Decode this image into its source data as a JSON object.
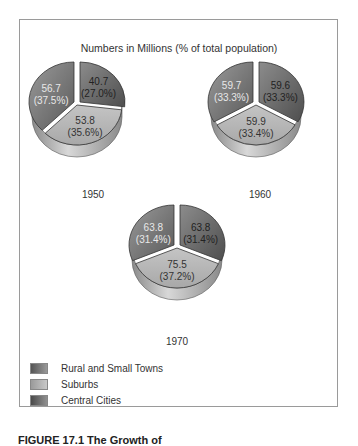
{
  "chart_data": {
    "type": "pie",
    "title": "Numbers in Millions (% of total population)",
    "legend": {
      "position": "bottom-left",
      "entries": [
        {
          "name": "Rural and Small Towns",
          "color": "#6e6e6e"
        },
        {
          "name": "Suburbs",
          "color": "#b4b4b4"
        },
        {
          "name": "Central Cities",
          "color": "#6a6a6a"
        }
      ]
    },
    "categories": [
      "Rural and Small Towns",
      "Central Cities",
      "Suburbs"
    ],
    "pies": [
      {
        "year": "1950",
        "slices": [
          {
            "category": "Rural and Small Towns",
            "value": 56.7,
            "percent": 37.5,
            "label_value": "56.7",
            "label_pct": "(37.5%)"
          },
          {
            "category": "Central Cities",
            "value": 40.7,
            "percent": 27.0,
            "label_value": "40.7",
            "label_pct": "(27.0%)"
          },
          {
            "category": "Suburbs",
            "value": 53.8,
            "percent": 35.6,
            "label_value": "53.8",
            "label_pct": "(35.6%)"
          }
        ]
      },
      {
        "year": "1960",
        "slices": [
          {
            "category": "Rural and Small Towns",
            "value": 59.7,
            "percent": 33.3,
            "label_value": "59.7",
            "label_pct": "(33.3%)"
          },
          {
            "category": "Central Cities",
            "value": 59.6,
            "percent": 33.3,
            "label_value": "59.6",
            "label_pct": "(33.3%)"
          },
          {
            "category": "Suburbs",
            "value": 59.9,
            "percent": 33.4,
            "label_value": "59.9",
            "label_pct": "(33.4%)"
          }
        ]
      },
      {
        "year": "1970",
        "slices": [
          {
            "category": "Rural and Small Towns",
            "value": 63.8,
            "percent": 31.4,
            "label_value": "63.8",
            "label_pct": "(31.4%)"
          },
          {
            "category": "Central Cities",
            "value": 63.8,
            "percent": 31.4,
            "label_value": "63.8",
            "label_pct": "(31.4%)"
          },
          {
            "category": "Suburbs",
            "value": 75.5,
            "percent": 37.2,
            "label_value": "75.5",
            "label_pct": "(37.2%)"
          }
        ]
      }
    ]
  },
  "caption": "FIGURE 17.1   The Growth of"
}
